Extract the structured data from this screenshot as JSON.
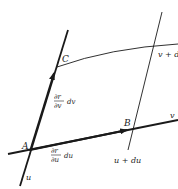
{
  "diagram": {
    "type": "parametric-surface-patch",
    "points": {
      "A": "A",
      "B": "B",
      "C": "C"
    },
    "curve_labels": {
      "u": "u",
      "v": "v",
      "u_plus_du": "u + du",
      "v_plus_dv": "v + d"
    },
    "vector_labels": {
      "dr_dv": {
        "numerator": "∂r",
        "denominator": "∂v",
        "suffix": "dv"
      },
      "dr_du": {
        "numerator": "∂r",
        "denominator": "∂u",
        "suffix": "du"
      }
    },
    "colors": {
      "line": "#1a1a1a",
      "background": "#ffffff"
    }
  }
}
